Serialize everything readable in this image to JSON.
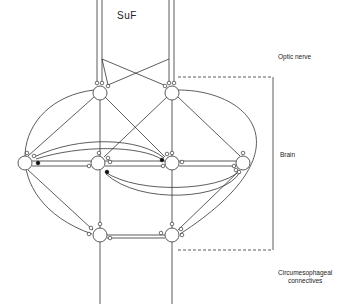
{
  "diagram": {
    "title_label": "SuF",
    "region_labels": {
      "optic_nerve": "Optic nerve",
      "brain": "Brain",
      "circumesophageal_line1": "Circumesophageal",
      "circumesophageal_line2": "connectives"
    },
    "colors": {
      "line": "#333333",
      "background": "#ffffff",
      "inhibitory_synapse": "#111111",
      "excitatory_synapse": "#ffffff"
    },
    "nodes": [
      {
        "id": "top-left",
        "x": 100,
        "y": 93
      },
      {
        "id": "top-right",
        "x": 172,
        "y": 93
      },
      {
        "id": "mid-far-left",
        "x": 25,
        "y": 163
      },
      {
        "id": "mid-left",
        "x": 98,
        "y": 163
      },
      {
        "id": "mid-right",
        "x": 172,
        "y": 163
      },
      {
        "id": "mid-far-right",
        "x": 243,
        "y": 163
      },
      {
        "id": "bottom-left",
        "x": 100,
        "y": 235
      },
      {
        "id": "bottom-right",
        "x": 172,
        "y": 235
      }
    ],
    "brackets": [
      {
        "region": "optic nerve to brain",
        "top_y": 77,
        "bottom_y": 250,
        "x": 273
      }
    ]
  }
}
